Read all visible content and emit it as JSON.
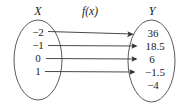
{
  "figure": {
    "type": "function-mapping-diagram",
    "domain_label": "X",
    "function_label": "f(x)",
    "codomain_label": "Y",
    "domain_elements": [
      {
        "value": "−2",
        "mapped": true
      },
      {
        "value": "−1",
        "mapped": true
      },
      {
        "value": "0",
        "mapped": true
      },
      {
        "value": "1",
        "mapped": true
      }
    ],
    "codomain_elements": [
      {
        "value": "36",
        "has_incoming_arrow": true
      },
      {
        "value": "18.5",
        "has_incoming_arrow": true
      },
      {
        "value": "6",
        "has_incoming_arrow": true
      },
      {
        "value": "−1.5",
        "has_incoming_arrow": true
      },
      {
        "value": "−4",
        "has_incoming_arrow": false
      }
    ],
    "mappings": [
      {
        "from": "−2",
        "to": "36"
      },
      {
        "from": "−1",
        "to": "18.5"
      },
      {
        "from": "0",
        "to": "6"
      },
      {
        "from": "1",
        "to": "−1.5"
      }
    ],
    "colors": {
      "stroke": "#4a4a4a",
      "arrow": "#333333",
      "text": "#1a1a1a",
      "background": "#ffffff"
    }
  }
}
